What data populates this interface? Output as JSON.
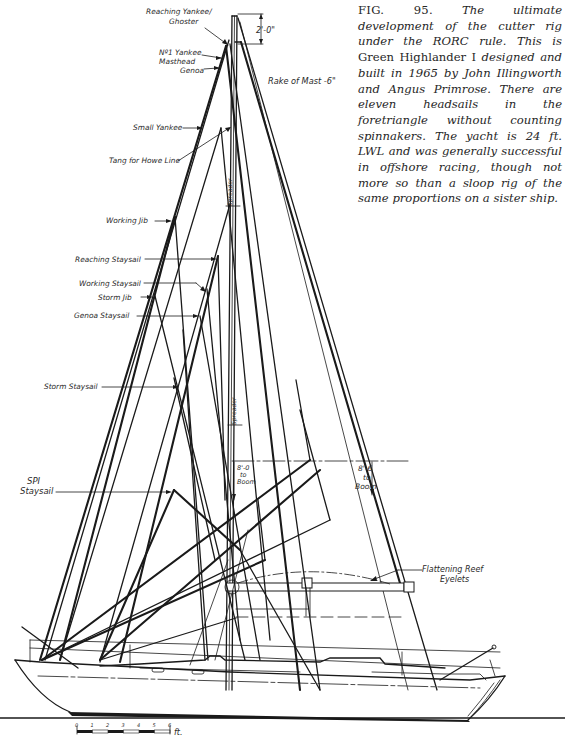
{
  "caption": {
    "fig_label": "FIG. 95.",
    "text_before_name": " The ultimate development of the cutter rig under the RORC rule. This is ",
    "boat_name": "Green Highlander I",
    "text_after_name": " designed and built in 1965 by John Illingworth and Angus Primrose. There are eleven headsails in the foretriangle without counting spinnakers. The yacht is 24 ft. LWL and was generally successful in offshore racing, though not more so than a sloop rig of the same proportions on a sister ship."
  },
  "labels": {
    "reaching_yankee_1": "Reaching Yankee/",
    "reaching_yankee_2": "Ghoster",
    "no1_yankee": "Nº1 Yankee",
    "masthead_genoa_1": "Masthead",
    "masthead_genoa_2": "Genoa",
    "small_yankee": "Small Yankee",
    "tang_howe_line": "Tang for Howe Line",
    "working_jib": "Working Jib",
    "reaching_staysail": "Reaching Staysail",
    "working_staysail": "Working Staysail",
    "storm_jib": "Storm Jib",
    "genoa_staysail": "Genoa Staysail",
    "storm_staysail": "Storm Staysail",
    "spi_staysail_1": "SPI",
    "spi_staysail_2": "Staysail",
    "spreader_upper": "Spreader",
    "spreader_lower": "Spreader",
    "rake_of_mast": "Rake of Mast -6\"",
    "dim_top": "2'-0\"",
    "boom_left_1": "8'-0",
    "boom_left_2": "to",
    "boom_left_3": "Boom",
    "boom_right_1": "8'-6",
    "boom_right_2": "to",
    "boom_right_3": "Boom",
    "reef_eyelets_1": "Flattening Reef",
    "reef_eyelets_2": "Eyelets"
  },
  "scale_bar": {
    "ticks": [
      "0",
      "1",
      "2",
      "3",
      "4",
      "5",
      "6"
    ],
    "unit": "ft."
  }
}
